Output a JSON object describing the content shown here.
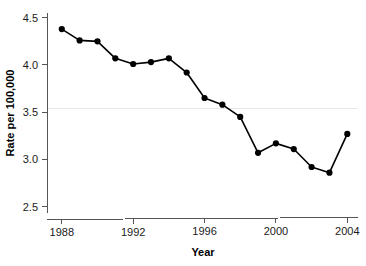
{
  "chart_data": {
    "type": "line",
    "title": "",
    "xlabel": "Year",
    "ylabel": "Rate per 100,000",
    "x": [
      1988,
      1989,
      1990,
      1991,
      1992,
      1993,
      1994,
      1995,
      1996,
      1997,
      1998,
      1999,
      2000,
      2001,
      2002,
      2003,
      2004
    ],
    "values": [
      4.38,
      4.26,
      4.25,
      4.07,
      4.01,
      4.03,
      4.07,
      3.92,
      3.65,
      3.58,
      3.45,
      3.07,
      3.17,
      3.11,
      2.92,
      2.86,
      3.27
    ],
    "series": [
      {
        "name": "Rate per 100,000",
        "values": [
          4.38,
          4.26,
          4.25,
          4.07,
          4.01,
          4.03,
          4.07,
          3.92,
          3.65,
          3.58,
          3.45,
          3.07,
          3.17,
          3.11,
          2.92,
          2.86,
          3.27
        ]
      }
    ],
    "xlim": [
      1987.2,
      2004.6
    ],
    "ylim": [
      2.38,
      4.55
    ],
    "x_ticks": [
      1988,
      1992,
      1996,
      2000,
      2004
    ],
    "x_tick_labels": [
      "1988",
      "1992",
      "1996",
      "2000",
      "2004"
    ],
    "y_ticks": [
      2.5,
      3.0,
      3.5,
      4.0,
      4.5
    ],
    "y_tick_labels": [
      "2.5",
      "3.0",
      "3.5",
      "4.0",
      "4.5"
    ],
    "grid": "single-horizontal-at-3.5",
    "legend": "none",
    "marker": "filled-circle",
    "line_color": "#000000",
    "marker_color": "#000000",
    "grid_color": "#e8e8e8",
    "axis_color": "#555555"
  }
}
